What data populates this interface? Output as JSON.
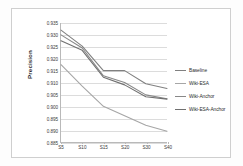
{
  "chart_data": {
    "type": "line",
    "title": "",
    "xlabel": "",
    "ylabel": "Precision",
    "categories": [
      "S5",
      "S10",
      "S15",
      "S20",
      "S30",
      "S40"
    ],
    "x_positions": [
      0,
      20,
      40,
      60,
      80,
      100
    ],
    "ylim": [
      0.885,
      0.935
    ],
    "yticks": [
      "0.885",
      "0.890",
      "0.895",
      "0.900",
      "0.905",
      "0.910",
      "0.915",
      "0.920",
      "0.925",
      "0.930",
      "0.935"
    ],
    "ytick_values": [
      0.885,
      0.89,
      0.895,
      0.9,
      0.905,
      0.91,
      0.915,
      0.92,
      0.925,
      0.93,
      0.935
    ],
    "grid": true,
    "legend_position": "right",
    "series": [
      {
        "name": "Baseline",
        "color": "#808080",
        "values": [
          0.932,
          0.9253,
          0.915,
          0.915,
          0.9095,
          0.9075
        ]
      },
      {
        "name": "Wiki-ESA",
        "color": "#a6a6a6",
        "values": [
          0.9175,
          0.9085,
          0.9,
          0.896,
          0.892,
          0.8895
        ]
      },
      {
        "name": "Wiki-Anchor",
        "color": "#888888",
        "values": [
          0.93,
          0.9245,
          0.9128,
          0.91,
          0.9048,
          0.9032
        ]
      },
      {
        "name": "Wiki-ESA-Anchor",
        "color": "#707070",
        "values": [
          0.9275,
          0.9235,
          0.9122,
          0.909,
          0.904,
          0.903
        ]
      }
    ]
  },
  "legend": {
    "items": [
      {
        "label": "Baseline"
      },
      {
        "label": "Wiki-ESA"
      },
      {
        "label": "Wiki-Anchor"
      },
      {
        "label": "Wiki-ESA-Anchor"
      }
    ]
  }
}
